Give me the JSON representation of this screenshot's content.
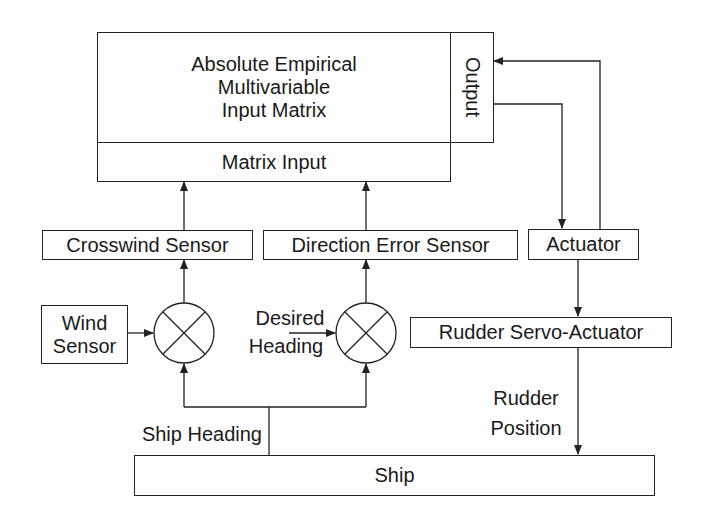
{
  "diagram": {
    "main_block": {
      "title_lines": [
        "Absolute Empirical",
        "Multivariable",
        "Input Matrix"
      ],
      "input_section": "Matrix Input",
      "output_section": "Output"
    },
    "blocks": {
      "crosswind_sensor": "Crosswind Sensor",
      "direction_error_sensor": "Direction Error Sensor",
      "actuator": "Actuator",
      "wind_sensor_lines": [
        "Wind",
        "Sensor"
      ],
      "rudder_servo_actuator": "Rudder Servo-Actuator",
      "ship": "Ship"
    },
    "junctions": [
      {
        "id": "crosswind-summing-junction",
        "symbol": "multiply-circle"
      },
      {
        "id": "heading-summing-junction",
        "symbol": "multiply-circle"
      }
    ],
    "signal_labels": {
      "desired_heading_lines": [
        "Desired",
        "Heading"
      ],
      "ship_heading": "Ship Heading",
      "rudder_position_lines": [
        "Rudder",
        "Position"
      ]
    },
    "colors": {
      "stroke": "#222222",
      "background": "#ffffff",
      "text": "#1a1a1a"
    }
  }
}
